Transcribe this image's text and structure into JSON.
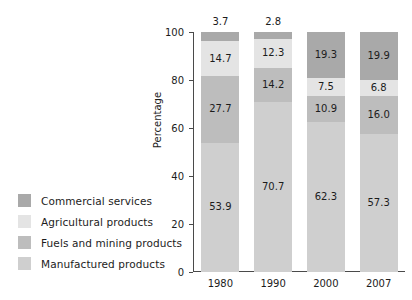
{
  "chart_data": {
    "type": "bar",
    "subtype": "stacked-100-percent",
    "title": "",
    "xlabel": "",
    "ylabel": "Percentage",
    "ylim": [
      0,
      100
    ],
    "yticks": [
      0,
      20,
      40,
      60,
      80,
      100
    ],
    "grid": false,
    "legend_position": "bottom-left-outside",
    "categories": [
      "1980",
      "1990",
      "2000",
      "2007"
    ],
    "stack_order_bottom_to_top": [
      "Manufactured products",
      "Fuels and mining products",
      "Agricultural products",
      "Commercial services"
    ],
    "series": [
      {
        "name": "Commercial services",
        "color": "#a9a9a9",
        "values": [
          3.7,
          2.8,
          19.3,
          19.9
        ],
        "labels": [
          "3.7",
          "2.8",
          "19.3",
          "19.9"
        ],
        "label_placement": [
          "outside",
          "outside",
          "inside",
          "inside"
        ]
      },
      {
        "name": "Agricultural products",
        "color": "#e4e4e4",
        "values": [
          14.7,
          12.3,
          7.5,
          6.8
        ],
        "labels": [
          "14.7",
          "12.3",
          "7.5",
          "6.8"
        ],
        "label_placement": [
          "inside",
          "inside",
          "inside",
          "inside"
        ]
      },
      {
        "name": "Fuels and mining products",
        "color": "#bdbdbd",
        "values": [
          27.7,
          14.2,
          10.9,
          16.0
        ],
        "labels": [
          "27.7",
          "14.2",
          "10.9",
          "16.0"
        ],
        "label_placement": [
          "inside",
          "inside",
          "inside",
          "inside"
        ]
      },
      {
        "name": "Manufactured products",
        "color": "#cfcfcf",
        "values": [
          53.9,
          70.7,
          62.3,
          57.3
        ],
        "labels": [
          "53.9",
          "70.7",
          "62.3",
          "57.3"
        ],
        "label_placement": [
          "inside",
          "inside",
          "inside",
          "inside"
        ]
      }
    ]
  },
  "legend": {
    "items": [
      {
        "label": "Commercial services",
        "color": "#a9a9a9"
      },
      {
        "label": "Agricultural products",
        "color": "#e4e4e4"
      },
      {
        "label": "Fuels and mining products",
        "color": "#bdbdbd"
      },
      {
        "label": "Manufactured products",
        "color": "#cfcfcf"
      }
    ]
  },
  "axes": {
    "y_title": "Percentage",
    "y_tick_labels": [
      "100",
      "80",
      "60",
      "40",
      "20",
      "0"
    ],
    "x_tick_labels": [
      "1980",
      "1990",
      "2000",
      "2007"
    ]
  }
}
